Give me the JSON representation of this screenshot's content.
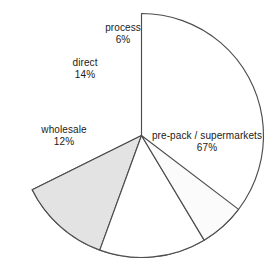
{
  "chart_data": {
    "type": "pie",
    "title": "",
    "subtitle": "",
    "xlabel": "",
    "ylabel": "",
    "legend": "none",
    "grid": false,
    "start_angle_deg": 90,
    "direction": "counterclockwise",
    "units": "percent",
    "categories": [
      "process",
      "direct",
      "wholesale",
      "pre-pack / supermarkets"
    ],
    "values": [
      6,
      14,
      12,
      67
    ],
    "slices": [
      {
        "label": "process",
        "value": 6,
        "value_text": "6%",
        "fill": "#fbfbfb",
        "stroke": "#4d4d4d"
      },
      {
        "label": "direct",
        "value": 14,
        "value_text": "14%",
        "fill": "#ffffff",
        "stroke": "#4d4d4d"
      },
      {
        "label": "wholesale",
        "value": 12,
        "value_text": "12%",
        "fill": "#e3e3e3",
        "stroke": "#4d4d4d"
      },
      {
        "label": "pre-pack / supermarkets",
        "value": 67,
        "value_text": "67%",
        "fill": "#ffffff",
        "stroke": "#4d4d4d"
      }
    ]
  },
  "colors": {
    "background": "#ffffff",
    "outline": "#4d4d4d",
    "text": "#1a1a1a",
    "shaded_slice": "#e3e3e3",
    "light_slice": "#fbfbfb"
  }
}
